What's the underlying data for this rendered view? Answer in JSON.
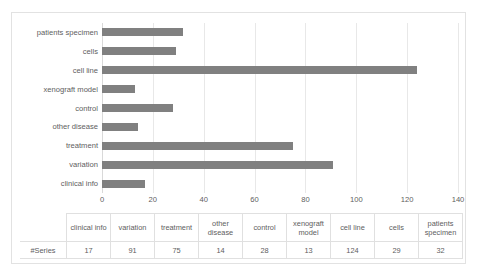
{
  "chart_data": {
    "type": "bar",
    "orientation": "horizontal",
    "title": "",
    "xlabel": "",
    "ylabel": "",
    "categories": [
      "clinical info",
      "variation",
      "treatment",
      "other disease",
      "control",
      "xenograft model",
      "cell line",
      "cells",
      "patients specimen"
    ],
    "values": [
      17,
      91,
      75,
      14,
      28,
      13,
      124,
      29,
      32
    ],
    "series_name": "#Series",
    "xlim": [
      0,
      140
    ],
    "xticks": [
      0,
      20,
      40,
      60,
      80,
      100,
      120,
      140
    ],
    "xtick_labels": [
      "0",
      "20",
      "40",
      "60",
      "80",
      "100",
      "120",
      "140"
    ],
    "grid": true,
    "grid_axis": "x",
    "legend": false,
    "bar_color": "#808080",
    "gridline_color": "#e8e8e8",
    "text_color": "#606060",
    "y_order_top_to_bottom": [
      "patients specimen",
      "cells",
      "cell line",
      "xenograft model",
      "control",
      "other disease",
      "treatment",
      "variation",
      "clinical info"
    ]
  },
  "table": {
    "row_label_header": "",
    "row_label": "#Series",
    "columns": [
      "clinical info",
      "variation",
      "treatment",
      "other disease",
      "control",
      "xenograft model",
      "cell line",
      "cells",
      "patients specimen"
    ],
    "values": [
      "17",
      "91",
      "75",
      "14",
      "28",
      "13",
      "124",
      "29",
      "32"
    ]
  }
}
